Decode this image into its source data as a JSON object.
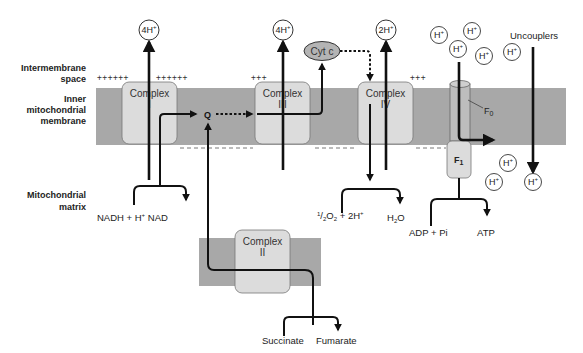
{
  "side_labels": {
    "intermembrane": [
      "Intermembrane",
      "space"
    ],
    "inner_membrane": [
      "Inner",
      "mitochondrial",
      "membrane"
    ],
    "matrix": [
      "Mitochondrial",
      "matrix"
    ]
  },
  "complexes": {
    "c1": {
      "line1": "Complex",
      "line2": "I"
    },
    "c2": {
      "line1": "Complex",
      "line2": "II"
    },
    "c3": {
      "line1": "Complex",
      "line2": "III"
    },
    "c4": {
      "line1": "Complex",
      "line2": "IV"
    },
    "f0": "F",
    "f0_sub": "0",
    "f1": "F",
    "f1_sub": "1"
  },
  "carriers": {
    "q": "Q",
    "cytc": "Cyt c"
  },
  "proton_pumps": {
    "c1": "4H",
    "c3": "4H",
    "c4": "2H",
    "sup": "+"
  },
  "free_protons": {
    "label": "H",
    "sup": "+"
  },
  "charges": {
    "plus6": "++++++",
    "plus3": "+++",
    "minus": "- - - - - -"
  },
  "reactions": {
    "nadh": "NADH + H",
    "nadh_sup": "+",
    "nad": "NAD",
    "o2_half": "1",
    "o2_slash": "/",
    "o2_two": "2",
    "o2": "O",
    "o2_sub": "2",
    "o2_rest": " + 2H",
    "o2_sup": "+",
    "h2o_h": "H",
    "h2o_sub": "2",
    "h2o_o": "O",
    "adp": "ADP + Pi",
    "atp": "ATP",
    "succinate": "Succinate",
    "fumarate": "Fumarate"
  },
  "uncouplers": "Uncouplers",
  "colors": {
    "membrane": "#a8a8a8",
    "complex_fill": "#dcdcdc",
    "cytc_fill": "#b4b4b4",
    "line": "#111111"
  }
}
